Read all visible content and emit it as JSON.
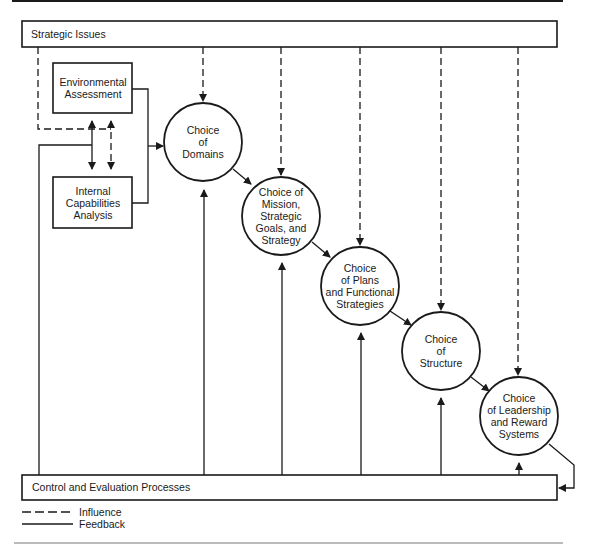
{
  "diagram": {
    "top_bar": {
      "label": "Strategic Issues"
    },
    "bottom_bar": {
      "label": "Control and Evaluation Processes"
    },
    "boxes": [
      {
        "id": "environmental",
        "lines": [
          "Environmental",
          "Assessment"
        ]
      },
      {
        "id": "internal",
        "lines": [
          "Internal",
          "Capabilities",
          "Analysis"
        ]
      }
    ],
    "circles": [
      {
        "id": "domains",
        "lines": [
          "Choice",
          "of",
          "Domains"
        ]
      },
      {
        "id": "mission",
        "lines": [
          "Choice of",
          "Mission,",
          "Strategic",
          "Goals, and",
          "Strategy"
        ]
      },
      {
        "id": "plans",
        "lines": [
          "Choice",
          "of Plans",
          "and Functional",
          "Strategies"
        ]
      },
      {
        "id": "structure",
        "lines": [
          "Choice",
          "of",
          "Structure"
        ]
      },
      {
        "id": "leadership",
        "lines": [
          "Choice",
          "of Leadership",
          "and Reward",
          "Systems"
        ]
      }
    ],
    "legend": {
      "influence": {
        "label": "Influence",
        "style": "dashed"
      },
      "feedback": {
        "label": "Feedback",
        "style": "solid"
      }
    },
    "colors": {
      "line": "#1a1a1a",
      "background": "#ffffff",
      "rule": "#555555"
    }
  }
}
